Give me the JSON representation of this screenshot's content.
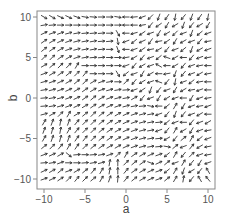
{
  "chart_data": {
    "type": "quiver",
    "title": "",
    "xlabel": "a",
    "ylabel": "b",
    "xlim": [
      -10,
      10
    ],
    "ylim": [
      -10,
      10
    ],
    "xticks": [
      -10,
      -5,
      0,
      5,
      10
    ],
    "yticks": [
      -10,
      -5,
      0,
      5,
      10
    ],
    "xtick_labels": [
      "−10",
      "−5",
      "0",
      "5",
      "10"
    ],
    "ytick_labels": [
      "−10",
      "−5",
      "0",
      "5",
      "10"
    ],
    "grid": false,
    "legend": null,
    "grid_x": [
      -10,
      -9,
      -8,
      -7,
      -6,
      -5,
      -4,
      -3,
      -2,
      -1,
      0,
      1,
      2,
      3,
      4,
      5,
      6,
      7,
      8,
      9,
      10
    ],
    "grid_y": [
      10,
      9,
      8,
      7,
      6,
      5,
      4,
      3,
      2,
      1,
      0,
      -1,
      -2,
      -3,
      -4,
      -5,
      -6,
      -7,
      -8,
      -9,
      -10
    ],
    "arrow_angles_deg_note": "angle of each arrow (0 = pointing +a, 90 = pointing +b); rows ordered b=10 to b=-10, columns a=-10 to a=10",
    "arrow_angles_deg": [
      [
        -30,
        -30,
        -25,
        -25,
        -20,
        -10,
        -5,
        0,
        0,
        -10,
        180,
        185,
        200,
        225,
        250,
        235,
        260,
        230,
        250,
        235,
        260
      ],
      [
        10,
        5,
        0,
        0,
        0,
        0,
        0,
        0,
        0,
        0,
        180,
        180,
        190,
        230,
        215,
        240,
        210,
        250,
        230,
        210,
        240
      ],
      [
        25,
        20,
        20,
        15,
        10,
        5,
        5,
        5,
        0,
        -60,
        180,
        195,
        215,
        200,
        240,
        210,
        225,
        200,
        250,
        220,
        200
      ],
      [
        35,
        30,
        25,
        20,
        15,
        10,
        10,
        5,
        5,
        -80,
        200,
        220,
        205,
        235,
        190,
        215,
        240,
        210,
        200,
        230,
        190
      ],
      [
        40,
        35,
        30,
        20,
        15,
        10,
        10,
        5,
        0,
        -70,
        180,
        200,
        215,
        190,
        210,
        230,
        200,
        220,
        250,
        210,
        200
      ],
      [
        45,
        45,
        35,
        30,
        20,
        10,
        5,
        5,
        0,
        0,
        190,
        210,
        230,
        200,
        220,
        160,
        210,
        180,
        230,
        200,
        190
      ],
      [
        30,
        40,
        45,
        45,
        60,
        0,
        0,
        0,
        0,
        0,
        200,
        230,
        210,
        200,
        150,
        180,
        210,
        230,
        200,
        190,
        180
      ],
      [
        20,
        30,
        35,
        40,
        45,
        50,
        0,
        0,
        0,
        -60,
        220,
        200,
        240,
        210,
        180,
        190,
        250,
        230,
        200,
        210,
        190
      ],
      [
        15,
        20,
        25,
        30,
        40,
        45,
        30,
        20,
        10,
        0,
        45,
        230,
        210,
        200,
        160,
        230,
        260,
        200,
        220,
        190,
        180
      ],
      [
        10,
        15,
        20,
        25,
        30,
        35,
        30,
        20,
        15,
        10,
        5,
        200,
        215,
        250,
        230,
        200,
        240,
        210,
        190,
        200,
        180
      ],
      [
        5,
        10,
        15,
        20,
        25,
        35,
        40,
        30,
        20,
        15,
        10,
        30,
        230,
        200,
        240,
        210,
        200,
        180,
        240,
        200,
        190
      ],
      [
        5,
        10,
        15,
        20,
        25,
        30,
        35,
        30,
        25,
        20,
        15,
        10,
        5,
        -10,
        180,
        220,
        60,
        240,
        200,
        190,
        200
      ],
      [
        15,
        30,
        45,
        60,
        30,
        40,
        45,
        40,
        35,
        30,
        25,
        20,
        15,
        10,
        200,
        230,
        250,
        230,
        200,
        210,
        180
      ],
      [
        60,
        70,
        80,
        70,
        50,
        45,
        45,
        40,
        35,
        30,
        25,
        20,
        15,
        10,
        5,
        220,
        200,
        180,
        230,
        200,
        210
      ],
      [
        70,
        75,
        80,
        60,
        50,
        45,
        45,
        40,
        35,
        30,
        25,
        20,
        15,
        10,
        200,
        230,
        60,
        210,
        240,
        200,
        190
      ],
      [
        60,
        70,
        75,
        70,
        55,
        50,
        45,
        40,
        35,
        30,
        25,
        20,
        15,
        10,
        5,
        210,
        230,
        40,
        60,
        220,
        200
      ],
      [
        40,
        45,
        50,
        60,
        55,
        45,
        40,
        35,
        30,
        30,
        25,
        20,
        15,
        10,
        5,
        -10,
        40,
        200,
        50,
        210,
        190
      ],
      [
        20,
        25,
        30,
        -40,
        5,
        0,
        5,
        10,
        20,
        45,
        60,
        35,
        30,
        25,
        20,
        220,
        60,
        230,
        45,
        200,
        190
      ],
      [
        5,
        10,
        20,
        0,
        0,
        5,
        10,
        15,
        80,
        90,
        45,
        40,
        35,
        -20,
        25,
        40,
        200,
        60,
        230,
        240,
        200
      ],
      [
        25,
        30,
        40,
        20,
        30,
        40,
        50,
        60,
        80,
        90,
        50,
        35,
        30,
        25,
        20,
        220,
        60,
        250,
        210,
        230,
        120
      ],
      [
        20,
        25,
        35,
        45,
        50,
        45,
        40,
        60,
        70,
        85,
        50,
        40,
        30,
        25,
        20,
        40,
        60,
        80,
        230,
        120,
        130
      ]
    ],
    "arrow_color": "#333333",
    "frame_color": "#888888",
    "background": "#ffffff"
  }
}
